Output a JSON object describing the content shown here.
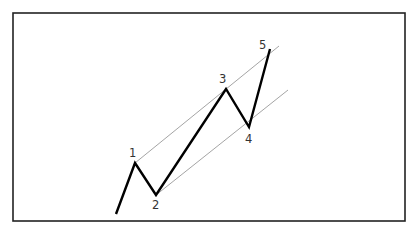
{
  "diagram": {
    "frame": {
      "x": 13,
      "y": 13,
      "width": 392,
      "height": 208,
      "color": "#222222"
    },
    "wave_path": {
      "color": "#000000",
      "points": [
        {
          "x": 116,
          "y": 214
        },
        {
          "x": 135,
          "y": 163
        },
        {
          "x": 156,
          "y": 195
        },
        {
          "x": 226,
          "y": 89
        },
        {
          "x": 249,
          "y": 127
        },
        {
          "x": 270,
          "y": 49
        }
      ]
    },
    "channel_lines": [
      {
        "name": "upper",
        "x1": 135,
        "y1": 163,
        "x2": 279,
        "y2": 46,
        "color": "#9a9a9a"
      },
      {
        "name": "lower",
        "x1": 156,
        "y1": 195,
        "x2": 288,
        "y2": 90,
        "color": "#9a9a9a"
      }
    ],
    "labels": [
      {
        "text": "1",
        "x": 129,
        "y": 157
      },
      {
        "text": "2",
        "x": 152,
        "y": 209
      },
      {
        "text": "3",
        "x": 219,
        "y": 83
      },
      {
        "text": "4",
        "x": 245,
        "y": 143
      },
      {
        "text": "5",
        "x": 259,
        "y": 49
      }
    ]
  }
}
